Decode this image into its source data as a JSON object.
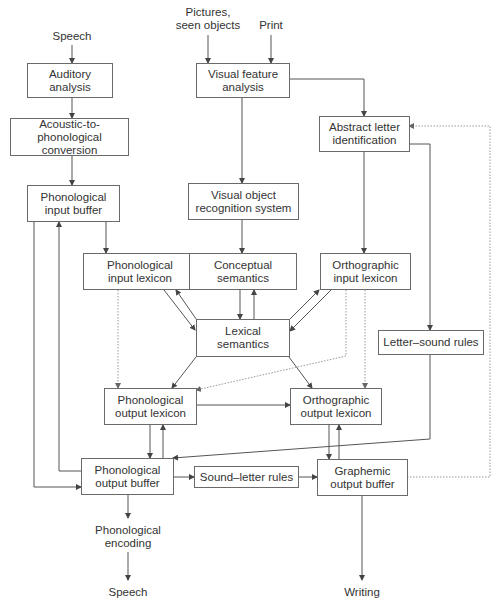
{
  "diagram": {
    "inputs": {
      "speech": "Speech",
      "pictures": "Pictures,\nseen objects",
      "print": "Print"
    },
    "boxes": {
      "auditory_analysis": "Auditory analysis",
      "acoustic_to_phonological": "Acoustic-to-phonological\nconversion",
      "phonological_input_buffer": "Phonological\ninput buffer",
      "visual_feature_analysis": "Visual feature\nanalysis",
      "abstract_letter_identification": "Abstract letter\nidentification",
      "visual_object_recognition": "Visual object\nrecognition system",
      "phonological_input_lexicon": "Phonological\ninput lexicon",
      "conceptual_semantics": "Conceptual\nsemantics",
      "orthographic_input_lexicon": "Orthographic\ninput lexicon",
      "lexical_semantics": "Lexical\nsemantics",
      "letter_sound_rules": "Letter–sound rules",
      "phonological_output_lexicon": "Phonological\noutput lexicon",
      "orthographic_output_lexicon": "Orthographic\noutput lexicon",
      "phonological_output_buffer": "Phonological\noutput buffer",
      "sound_letter_rules": "Sound–letter rules",
      "graphemic_output_buffer": "Graphemic\noutput buffer"
    },
    "outputs": {
      "phonological_encoding": "Phonological\nencoding",
      "speech_out": "Speech",
      "writing": "Writing"
    },
    "colors": {
      "line": "#555555",
      "dotted": "#999999",
      "border": "#6a6a6a",
      "text": "#333333"
    }
  }
}
